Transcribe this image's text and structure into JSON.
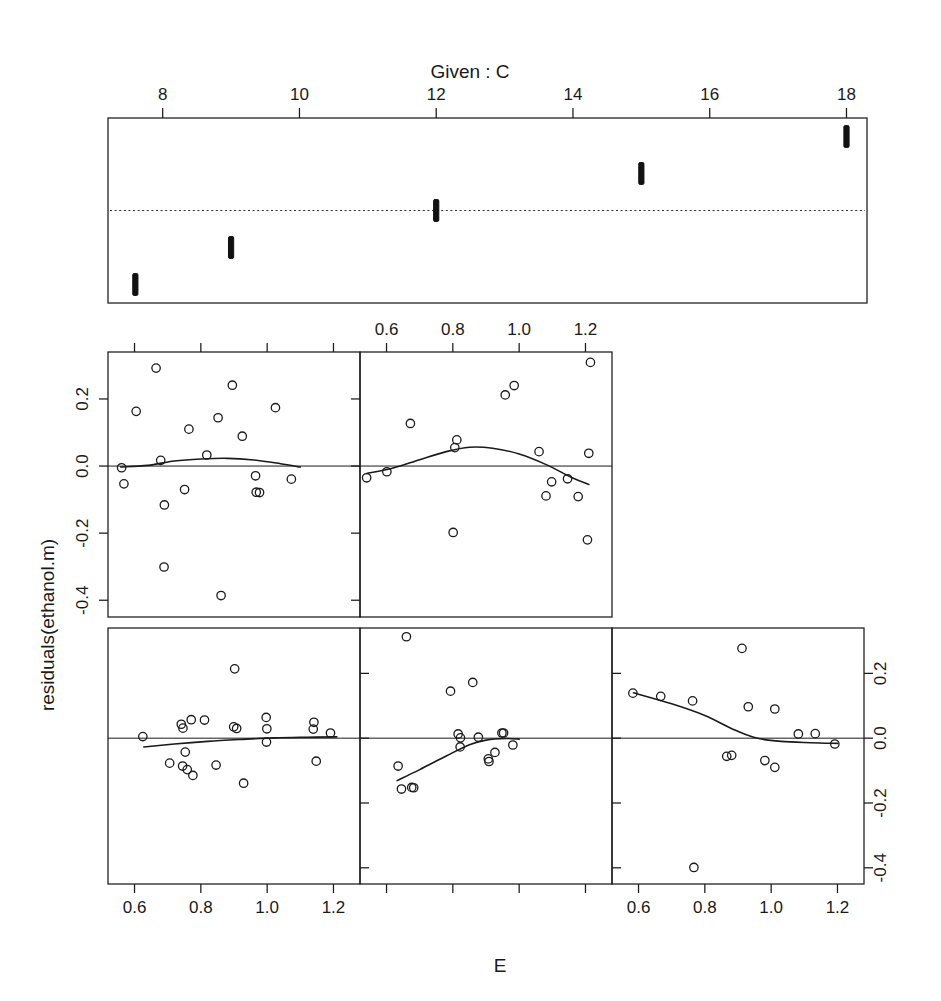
{
  "figure": {
    "given_title": "Given :  C",
    "x_axis_title": "E",
    "y_axis_title": "residuals(ethanol.m)"
  },
  "chart_data": {
    "type": "scatter",
    "title": "Given :  C",
    "xlabel": "E",
    "ylabel": "residuals(ethanol.m)",
    "plot_kind": "coplot",
    "grid": false,
    "legend": null,
    "conditioning_variable": "C",
    "response_variable": "residuals(ethanol.m)",
    "predictor_variable": "E",
    "xlim": [
      0.52,
      1.28
    ],
    "ylim": [
      -0.45,
      0.34
    ],
    "x_ticks": [
      0.6,
      0.8,
      1.0,
      1.2
    ],
    "x_tick_labels": [
      "0.6",
      "0.8",
      "1.0",
      "1.2"
    ],
    "y_ticks": [
      0.2,
      0.0,
      -0.2,
      -0.4
    ],
    "y_tick_labels": [
      "0.2",
      "0.0",
      "-0.2",
      "-0.4"
    ],
    "given_axis": {
      "label": "C",
      "lim": [
        7.2,
        18.3
      ],
      "ticks": [
        8,
        10,
        12,
        14,
        16,
        18
      ],
      "tick_labels": [
        "8",
        "10",
        "12",
        "14",
        "16",
        "18"
      ],
      "intervals": [
        {
          "index": 1,
          "min": 7.5,
          "max": 7.7,
          "row": 0
        },
        {
          "index": 2,
          "min": 8.9,
          "max": 9.1,
          "row": 1
        },
        {
          "index": 3,
          "min": 11.9,
          "max": 12.1,
          "row": 2
        },
        {
          "index": 4,
          "min": 14.9,
          "max": 15.1,
          "row": 3
        },
        {
          "index": 5,
          "min": 17.9,
          "max": 18.1,
          "row": 4
        }
      ],
      "reference_dash_row": 2.5
    },
    "panels": [
      {
        "row": "bottom",
        "col": 1,
        "given_interval": 1,
        "show_x_labels": true,
        "show_y_labels": false,
        "points": [
          {
            "x": 0.625,
            "y": 0.005
          },
          {
            "x": 0.741,
            "y": 0.043
          },
          {
            "x": 0.746,
            "y": 0.031
          },
          {
            "x": 0.771,
            "y": 0.057
          },
          {
            "x": 0.811,
            "y": 0.056
          },
          {
            "x": 0.902,
            "y": 0.214
          },
          {
            "x": 0.899,
            "y": 0.035
          },
          {
            "x": 0.908,
            "y": 0.03
          },
          {
            "x": 0.997,
            "y": 0.064
          },
          {
            "x": 0.999,
            "y": 0.029
          },
          {
            "x": 0.998,
            "y": -0.012
          },
          {
            "x": 1.141,
            "y": 0.049
          },
          {
            "x": 1.139,
            "y": 0.028
          },
          {
            "x": 1.191,
            "y": 0.016
          },
          {
            "x": 0.753,
            "y": -0.043
          },
          {
            "x": 0.706,
            "y": -0.077
          },
          {
            "x": 0.745,
            "y": -0.086
          },
          {
            "x": 0.759,
            "y": -0.097
          },
          {
            "x": 0.776,
            "y": -0.115
          },
          {
            "x": 0.846,
            "y": -0.083
          },
          {
            "x": 0.929,
            "y": -0.139
          },
          {
            "x": 1.148,
            "y": -0.071
          }
        ],
        "smooth": [
          {
            "x": 0.628,
            "y": -0.027
          },
          {
            "x": 0.72,
            "y": -0.018
          },
          {
            "x": 0.82,
            "y": -0.01
          },
          {
            "x": 0.92,
            "y": -0.004
          },
          {
            "x": 1.02,
            "y": 0.001
          },
          {
            "x": 1.12,
            "y": 0.003
          },
          {
            "x": 1.21,
            "y": 0.004
          }
        ]
      },
      {
        "row": "bottom",
        "col": 2,
        "given_interval": 2,
        "show_x_labels": false,
        "show_y_labels": false,
        "points": [
          {
            "x": 0.66,
            "y": 0.313
          },
          {
            "x": 0.793,
            "y": 0.145
          },
          {
            "x": 0.86,
            "y": 0.172
          },
          {
            "x": 0.816,
            "y": 0.013
          },
          {
            "x": 0.823,
            "y": 0.001
          },
          {
            "x": 0.877,
            "y": 0.003
          },
          {
            "x": 0.948,
            "y": 0.016
          },
          {
            "x": 0.953,
            "y": 0.016
          },
          {
            "x": 0.822,
            "y": -0.027
          },
          {
            "x": 0.927,
            "y": -0.044
          },
          {
            "x": 0.907,
            "y": -0.064
          },
          {
            "x": 0.909,
            "y": -0.072
          },
          {
            "x": 0.981,
            "y": -0.021
          },
          {
            "x": 0.635,
            "y": -0.086
          },
          {
            "x": 0.645,
            "y": -0.157
          },
          {
            "x": 0.676,
            "y": -0.152
          },
          {
            "x": 0.682,
            "y": -0.153
          }
        ],
        "smooth": [
          {
            "x": 0.632,
            "y": -0.131
          },
          {
            "x": 0.7,
            "y": -0.097
          },
          {
            "x": 0.78,
            "y": -0.055
          },
          {
            "x": 0.85,
            "y": -0.02
          },
          {
            "x": 0.9,
            "y": -0.006
          },
          {
            "x": 0.96,
            "y": -0.001
          },
          {
            "x": 1.0,
            "y": -0.003
          }
        ]
      },
      {
        "row": "bottom",
        "col": 3,
        "given_interval": 3,
        "show_x_labels": true,
        "show_y_labels": true,
        "points": [
          {
            "x": 0.583,
            "y": 0.139
          },
          {
            "x": 0.667,
            "y": 0.129
          },
          {
            "x": 0.763,
            "y": 0.115
          },
          {
            "x": 0.912,
            "y": 0.277
          },
          {
            "x": 0.931,
            "y": 0.097
          },
          {
            "x": 1.011,
            "y": 0.09
          },
          {
            "x": 1.082,
            "y": 0.013
          },
          {
            "x": 1.133,
            "y": 0.014
          },
          {
            "x": 1.192,
            "y": -0.018
          },
          {
            "x": 0.866,
            "y": -0.056
          },
          {
            "x": 0.881,
            "y": -0.053
          },
          {
            "x": 0.981,
            "y": -0.069
          },
          {
            "x": 1.011,
            "y": -0.09
          },
          {
            "x": 0.767,
            "y": -0.399
          }
        ],
        "smooth": [
          {
            "x": 0.585,
            "y": 0.14
          },
          {
            "x": 0.7,
            "y": 0.106
          },
          {
            "x": 0.8,
            "y": 0.07
          },
          {
            "x": 0.88,
            "y": 0.03
          },
          {
            "x": 0.95,
            "y": 0.002
          },
          {
            "x": 1.03,
            "y": -0.01
          },
          {
            "x": 1.12,
            "y": -0.014
          },
          {
            "x": 1.2,
            "y": -0.016
          }
        ]
      },
      {
        "row": "top",
        "col": 1,
        "given_interval": 4,
        "show_x_labels": false,
        "show_y_labels": true,
        "points": [
          {
            "x": 0.665,
            "y": 0.292
          },
          {
            "x": 0.895,
            "y": 0.241
          },
          {
            "x": 0.605,
            "y": 0.163
          },
          {
            "x": 0.852,
            "y": 0.144
          },
          {
            "x": 1.025,
            "y": 0.174
          },
          {
            "x": 0.764,
            "y": 0.11
          },
          {
            "x": 0.925,
            "y": 0.089
          },
          {
            "x": 0.818,
            "y": 0.033
          },
          {
            "x": 0.679,
            "y": 0.017
          },
          {
            "x": 0.561,
            "y": -0.005
          },
          {
            "x": 0.965,
            "y": -0.029
          },
          {
            "x": 1.073,
            "y": -0.039
          },
          {
            "x": 0.568,
            "y": -0.053
          },
          {
            "x": 0.751,
            "y": -0.07
          },
          {
            "x": 0.967,
            "y": -0.078
          },
          {
            "x": 0.977,
            "y": -0.079
          },
          {
            "x": 0.69,
            "y": -0.116
          },
          {
            "x": 0.689,
            "y": -0.301
          },
          {
            "x": 0.861,
            "y": -0.386
          }
        ],
        "smooth": [
          {
            "x": 0.558,
            "y": -0.003
          },
          {
            "x": 0.64,
            "y": 0.002
          },
          {
            "x": 0.72,
            "y": 0.015
          },
          {
            "x": 0.8,
            "y": 0.021
          },
          {
            "x": 0.88,
            "y": 0.023
          },
          {
            "x": 0.96,
            "y": 0.018
          },
          {
            "x": 1.04,
            "y": 0.007
          },
          {
            "x": 1.1,
            "y": -0.003
          }
        ]
      },
      {
        "row": "top",
        "col": 2,
        "given_interval": 5,
        "show_x_labels": true,
        "show_y_labels": false,
        "points": [
          {
            "x": 1.215,
            "y": 0.309
          },
          {
            "x": 0.985,
            "y": 0.24
          },
          {
            "x": 0.958,
            "y": 0.212
          },
          {
            "x": 0.672,
            "y": 0.127
          },
          {
            "x": 0.812,
            "y": 0.078
          },
          {
            "x": 0.806,
            "y": 0.055
          },
          {
            "x": 1.06,
            "y": 0.043
          },
          {
            "x": 1.21,
            "y": 0.038
          },
          {
            "x": 0.601,
            "y": -0.017
          },
          {
            "x": 0.54,
            "y": -0.035
          },
          {
            "x": 1.098,
            "y": -0.047
          },
          {
            "x": 1.146,
            "y": -0.038
          },
          {
            "x": 1.081,
            "y": -0.089
          },
          {
            "x": 1.178,
            "y": -0.091
          },
          {
            "x": 0.801,
            "y": -0.198
          },
          {
            "x": 1.206,
            "y": -0.22
          }
        ],
        "smooth": [
          {
            "x": 0.54,
            "y": -0.022
          },
          {
            "x": 0.62,
            "y": -0.006
          },
          {
            "x": 0.7,
            "y": 0.019
          },
          {
            "x": 0.78,
            "y": 0.043
          },
          {
            "x": 0.85,
            "y": 0.056
          },
          {
            "x": 0.92,
            "y": 0.053
          },
          {
            "x": 1.0,
            "y": 0.036
          },
          {
            "x": 1.08,
            "y": 0.005
          },
          {
            "x": 1.16,
            "y": -0.035
          },
          {
            "x": 1.21,
            "y": -0.055
          }
        ]
      }
    ]
  }
}
